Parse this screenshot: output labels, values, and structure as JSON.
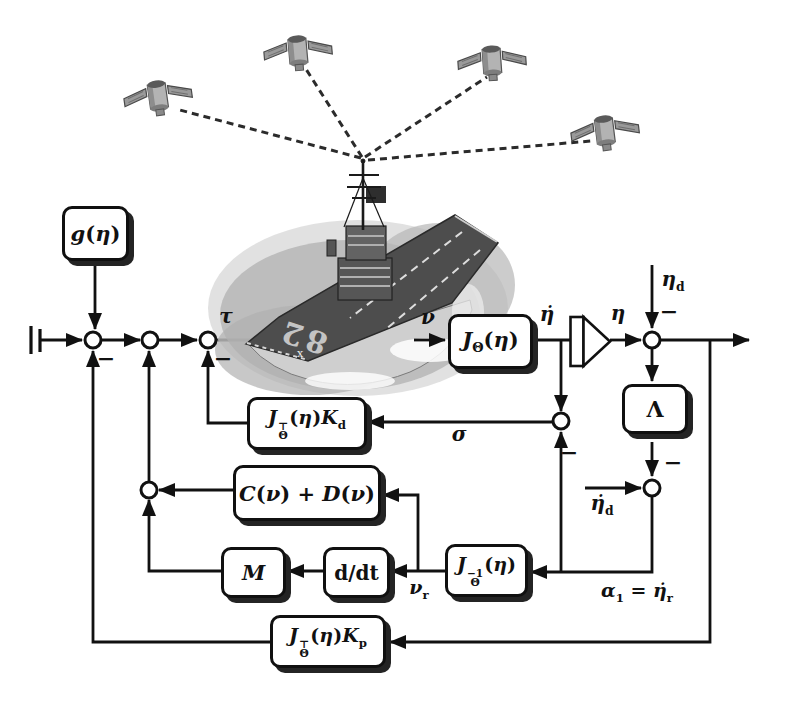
{
  "figure": {
    "blocks": {
      "g": "<i>g</i>(<i>η</i>)",
      "J": "<i>J</i><sub>Θ</sub>(<i>η</i>)",
      "Kd": "<i>J</i><span class=\"stk\"><span>⊤</span><span>Θ</span></span>(<i>η</i>)<i>K</i><sub>d</sub>",
      "CD": "<i>C</i>(<i>ν</i>) + <i>D</i>(<i>ν</i>)",
      "M": "<i>M</i>",
      "ddt": "d/dt",
      "Jinv": "<i>J</i><span class=\"stk\"><span>−1</span><span>Θ</span></span>(<i>η</i>)",
      "Lambda": "Λ",
      "Kp": "<i>J</i><span class=\"stk\"><span>⊤</span><span>Θ</span></span>(<i>η</i>)<i>K</i><sub>p</sub>"
    },
    "signals": {
      "tau": "<i>τ</i>",
      "nu": "<i>ν</i>",
      "eta_dot": "<i>η̇</i>",
      "eta": "<i>η</i>",
      "eta_d": "<i>η</i><sub>d</sub>",
      "sigma": "<i>σ</i>",
      "eta_dot_d": "<i>η̇</i><sub>d</sub>",
      "nu_r": "<i>ν</i><sub>r</sub>",
      "alpha1": "<i>α</i><sub>1</sub> = <i>η̇</i><sub>r</sub>",
      "minus": "−"
    },
    "ship_deck_number": "82",
    "colors": {
      "line": "#111111",
      "block_fill": "#ffffff",
      "block_border": "#101010",
      "shadow": "#242424",
      "deck": "#4d4d4d",
      "water": "#b0b0b0",
      "satellite_body": "#aaaaaa"
    }
  }
}
